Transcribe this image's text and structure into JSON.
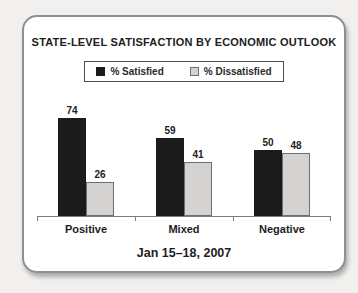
{
  "chart_data": {
    "type": "bar",
    "title": "STATE-LEVEL SATISFACTION BY ECONOMIC OUTLOOK",
    "categories": [
      "Positive",
      "Mixed",
      "Negative"
    ],
    "series": [
      {
        "name": "% Satisfied",
        "color": "#1b1b1b",
        "border": "#1b1b1b",
        "values": [
          74,
          59,
          50
        ]
      },
      {
        "name": "% Dissatisfied",
        "color": "#d4d3d1",
        "border": "#6f6f6f",
        "values": [
          26,
          41,
          48
        ]
      }
    ],
    "annotation": "Jan 15–18, 2007",
    "ylim": [
      0,
      80
    ],
    "grid": false,
    "legend_position": "top",
    "value_labels": true,
    "axis_ticks_percent": [
      0,
      33.333,
      66.667,
      100
    ]
  },
  "style": {
    "px_per_unit": 1.32,
    "axis_color": "#7d7d7d"
  }
}
